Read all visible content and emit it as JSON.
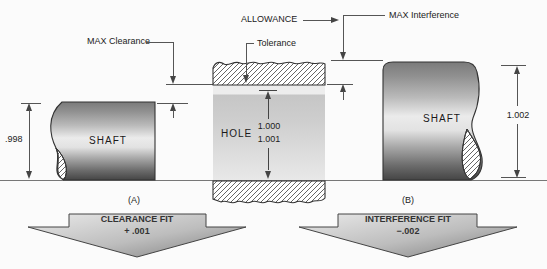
{
  "annotations": {
    "max_clearance": "MAX Clearance",
    "allowance": "ALLOWANCE",
    "max_interference": "MAX Interference",
    "tolerance": "Tolerance"
  },
  "left_shaft": {
    "label": "SHAFT",
    "dimension": ".998"
  },
  "hole": {
    "label": "HOLE",
    "dim_min": "1.000",
    "dim_max": "1.001"
  },
  "right_shaft": {
    "label": "SHAFT",
    "dimension": "1.002"
  },
  "panels": {
    "a": "(A)",
    "b": "(B)"
  },
  "fits": {
    "clearance": {
      "title": "CLEARANCE FIT",
      "value": "+ .001"
    },
    "interference": {
      "title": "INTERFERENCE FIT",
      "value": "−.002"
    }
  },
  "colors": {
    "line": "#555555",
    "text": "#222222",
    "hatch": "#555555"
  }
}
